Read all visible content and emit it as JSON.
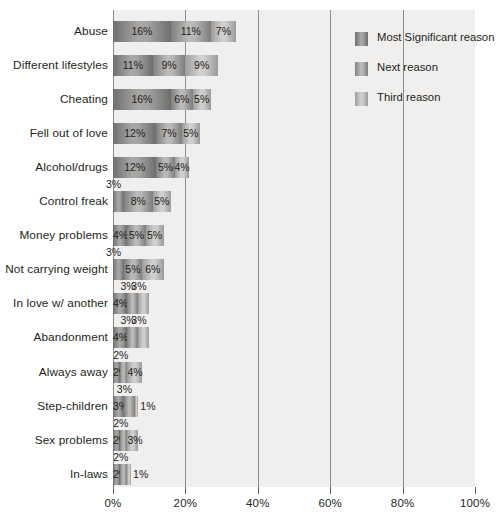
{
  "chart_data": {
    "type": "bar",
    "orientation": "horizontal",
    "stacked": true,
    "title": "",
    "xlabel": "",
    "ylabel": "",
    "xlim": [
      0,
      100
    ],
    "xticks": [
      "0%",
      "20%",
      "40%",
      "60%",
      "80%",
      "100%"
    ],
    "xtick_values": [
      0,
      20,
      40,
      60,
      80,
      100
    ],
    "grid": true,
    "grid_axis": "x",
    "legend_position": "top-right",
    "categories": [
      "Abuse",
      "Different lifestyles",
      "Cheating",
      "Fell out of love",
      "Alcohol/drugs",
      "Control freak",
      "Money problems",
      "Not carrying weight",
      "In love w/ another",
      "Abandonment",
      "Always away",
      "Step-children",
      "Sex problems",
      "In-laws"
    ],
    "series": [
      {
        "name": "Most Significant reason",
        "color": "#8a8a88",
        "values": [
          16,
          11,
          16,
          12,
          12,
          3,
          4,
          3,
          4,
          4,
          2,
          3,
          2,
          2
        ],
        "labels": [
          "16%",
          "11%",
          "16%",
          "12%",
          "12%",
          "3%",
          "4%",
          "3%",
          "4%",
          "4%",
          "2%",
          "3%",
          "2%",
          "2%"
        ]
      },
      {
        "name": "Next reason",
        "color": "#a6a5a3",
        "values": [
          11,
          9,
          6,
          7,
          5,
          8,
          5,
          5,
          3,
          3,
          2,
          3,
          2,
          2
        ],
        "labels": [
          "11%",
          "9%",
          "6%",
          "7%",
          "5%",
          "8%",
          "5%",
          "5%",
          "3%",
          "3%",
          "2%",
          "3%",
          "2%",
          "2%"
        ]
      },
      {
        "name": "Third reason",
        "color": "#c9c8c6",
        "values": [
          7,
          9,
          5,
          5,
          4,
          5,
          5,
          6,
          3,
          3,
          4,
          1,
          3,
          1
        ],
        "labels": [
          "7%",
          "9%",
          "5%",
          "5%",
          "4%",
          "5%",
          "5%",
          "6%",
          "3%",
          "3%",
          "4%",
          "1%",
          "3%",
          "1%"
        ]
      }
    ],
    "label_placement": [
      [
        "in",
        "in",
        "in"
      ],
      [
        "in",
        "in",
        "in"
      ],
      [
        "in",
        "in",
        "in"
      ],
      [
        "in",
        "in",
        "in"
      ],
      [
        "in",
        "in",
        "in"
      ],
      [
        "above",
        "in",
        "in"
      ],
      [
        "in",
        "in",
        "in"
      ],
      [
        "above",
        "in",
        "in"
      ],
      [
        "in",
        "above",
        "above"
      ],
      [
        "in",
        "above",
        "above"
      ],
      [
        "in",
        "above",
        "in"
      ],
      [
        "in",
        "above",
        "outside"
      ],
      [
        "in",
        "above",
        "in"
      ],
      [
        "in",
        "above",
        "outside"
      ]
    ]
  },
  "legend": {
    "items": [
      {
        "label": "Most Significant reason",
        "swatch": "#8a8a88"
      },
      {
        "label": "Next reason",
        "swatch": "#a6a5a3"
      },
      {
        "label": "Third reason",
        "swatch": "#c9c8c6"
      }
    ]
  }
}
